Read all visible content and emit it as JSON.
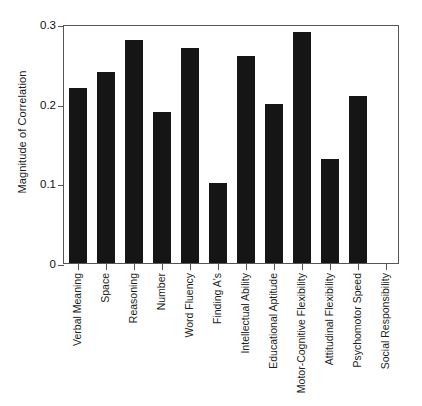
{
  "chart_data": {
    "type": "bar",
    "title": "",
    "xlabel": "",
    "ylabel": "Magnitude of Correlation",
    "ylim": [
      0,
      0.3
    ],
    "yticks": [
      "0",
      "0.1",
      "0.2",
      "0.3"
    ],
    "ytick_values": [
      0,
      0.1,
      0.2,
      0.3
    ],
    "grid": false,
    "legend": "none",
    "bar_color": "#151515",
    "axis_color": "#555555",
    "categories": [
      "Verbal Meaning",
      "Space",
      "Reasoning",
      "Number",
      "Word Fluency",
      "Finding A's",
      "Intellectual Ability",
      "Educational Aptitude",
      "Motor-Cognitive Flexibility",
      "Attitudinal Flexibility",
      "Psychomotor Speed",
      "Social Responsibility"
    ],
    "values": [
      0.22,
      0.24,
      0.28,
      0.19,
      0.27,
      0.1,
      0.26,
      0.2,
      0.29,
      0.13,
      0.21,
      0.0
    ]
  }
}
